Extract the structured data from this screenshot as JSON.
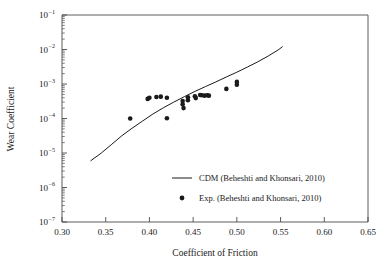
{
  "chart_data": {
    "type": "scatter",
    "title": "",
    "xlabel": "Coefficient of Friction",
    "ylabel": "Wear Coefficient",
    "xlim": [
      0.3,
      0.65
    ],
    "ylim": [
      1e-07,
      0.1
    ],
    "yscale": "log",
    "xscale": "linear",
    "grid": false,
    "xticks": [
      0.3,
      0.35,
      0.4,
      0.45,
      0.5,
      0.55,
      0.6,
      0.65
    ],
    "xtick_labels": [
      "0.30",
      "0.35",
      "0.40",
      "0.45",
      "0.50",
      "0.55",
      "0.60",
      "0.65"
    ],
    "yticks": [
      1e-07,
      1e-06,
      1e-05,
      0.0001,
      0.001,
      0.01,
      0.1
    ],
    "ytick_labels": [
      "10−7",
      "10−6",
      "10−5",
      "10−4",
      "10−3",
      "10−2",
      "10−1"
    ],
    "ytick_mantissa": "10",
    "ytick_exponents": [
      "-7",
      "-6",
      "-5",
      "-4",
      "-3",
      "-2",
      "-1"
    ],
    "y_minor_ticks": true,
    "x_minor_ticks": false,
    "legend_position": "lower right",
    "series": [
      {
        "name": "CDM (Beheshti and Khonsari, 2010)",
        "type": "line",
        "color": "#1a1a1a",
        "linewidth": 1,
        "points": [
          [
            0.333,
            6e-06
          ],
          [
            0.345,
            1e-05
          ],
          [
            0.357,
            1.8e-05
          ],
          [
            0.368,
            3.1e-05
          ],
          [
            0.38,
            5.2e-05
          ],
          [
            0.392,
            8.4e-05
          ],
          [
            0.404,
            0.000135
          ],
          [
            0.416,
            0.000205
          ],
          [
            0.428,
            0.0003
          ],
          [
            0.44,
            0.00043
          ],
          [
            0.452,
            0.00061
          ],
          [
            0.464,
            0.00084
          ],
          [
            0.476,
            0.00115
          ],
          [
            0.488,
            0.0016
          ],
          [
            0.5,
            0.0022
          ],
          [
            0.512,
            0.0031
          ],
          [
            0.524,
            0.0044
          ],
          [
            0.536,
            0.0065
          ],
          [
            0.548,
            0.01
          ],
          [
            0.552,
            0.012
          ]
        ]
      },
      {
        "name": "Exp. (Beheshti and Khonsari, 2010)",
        "type": "scatter",
        "color": "#1a1a1a",
        "marker": "circle",
        "markersize": 4.6,
        "points": [
          [
            0.378,
            0.0001
          ],
          [
            0.398,
            0.00037
          ],
          [
            0.4,
            0.0004
          ],
          [
            0.408,
            0.00042
          ],
          [
            0.413,
            0.00043
          ],
          [
            0.42,
            0.0004
          ],
          [
            0.42,
            0.000102
          ],
          [
            0.438,
            0.00032
          ],
          [
            0.438,
            0.00026
          ],
          [
            0.439,
            0.0002
          ],
          [
            0.444,
            0.00041
          ],
          [
            0.444,
            0.00034
          ],
          [
            0.452,
            0.00044
          ],
          [
            0.453,
            0.00039
          ],
          [
            0.458,
            0.00048
          ],
          [
            0.46,
            0.00047
          ],
          [
            0.463,
            0.00046
          ],
          [
            0.466,
            0.00047
          ],
          [
            0.468,
            0.00046
          ],
          [
            0.488,
            0.00072
          ],
          [
            0.5,
            0.00115
          ],
          [
            0.5,
            0.00095
          ]
        ]
      }
    ]
  },
  "legend": {
    "entries": [
      {
        "label": "CDM (Beheshti and Khonsari, 2010)",
        "marker": "line"
      },
      {
        "label": "Exp. (Beheshti and Khonsari, 2010)",
        "marker": "circle"
      }
    ]
  },
  "colors": {
    "axis": "#4a4a4a",
    "data": "#1a1a1a",
    "background": "#ffffff"
  }
}
